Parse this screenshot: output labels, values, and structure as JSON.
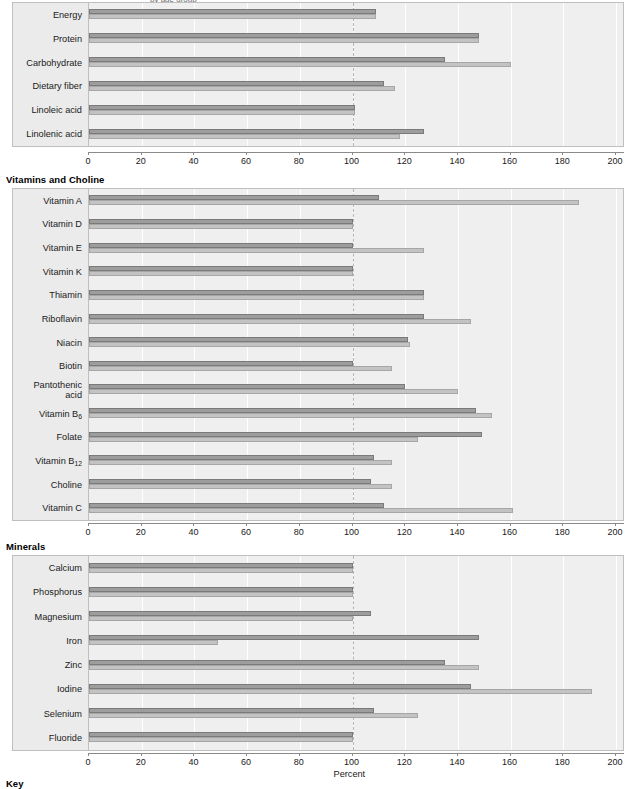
{
  "figure": {
    "axis_title": "Percent",
    "key_label": "Key",
    "clipped_top_text": "by age group"
  },
  "axis": {
    "ticks": [
      0,
      20,
      40,
      60,
      80,
      100,
      120,
      140,
      160,
      180,
      200
    ],
    "min": 0,
    "max": 200,
    "reference_value": 100
  },
  "legend": {
    "series_a_name": "Series A",
    "series_b_name": "Series B"
  },
  "colors": {
    "series_a": "#9d9d9d",
    "series_b": "#c3c3c3",
    "plot_background": "#efefef",
    "label_gutter": "#ebebeb",
    "gridline": "#ffffff",
    "reference_line": "#b5b5b5"
  },
  "sections": [
    {
      "title": "Macronutrients",
      "title_visible": false,
      "categories": [
        "Linolenic acid",
        "Linoleic acid",
        "Dietary fiber",
        "Carbohydrate",
        "Protein",
        "Energy"
      ],
      "series_a": [
        127,
        101,
        112,
        135,
        148,
        109
      ],
      "series_b": [
        118,
        101,
        116,
        160,
        148,
        109
      ]
    },
    {
      "title": "Vitamins and Choline",
      "title_visible": true,
      "categories": [
        "Vitamin C",
        "Choline",
        "Vitamin B₁₂",
        "Folate",
        "Vitamin B₆",
        "Pantothenic acid",
        "Biotin",
        "Niacin",
        "Riboflavin",
        "Thiamin",
        "Vitamin K",
        "Vitamin E",
        "Vitamin D",
        "Vitamin A"
      ],
      "series_a": [
        112,
        107,
        108,
        149,
        147,
        120,
        100,
        121,
        127,
        127,
        100,
        100,
        100,
        110
      ],
      "series_b": [
        161,
        115,
        115,
        125,
        153,
        140,
        115,
        122,
        145,
        127,
        100,
        127,
        100,
        186
      ]
    },
    {
      "title": "Minerals",
      "title_visible": true,
      "categories": [
        "Fluoride",
        "Selenium",
        "Iodine",
        "Zinc",
        "Iron",
        "Magnesium",
        "Phosphorus",
        "Calcium"
      ],
      "series_a": [
        100,
        108,
        145,
        135,
        148,
        107,
        100,
        100
      ],
      "series_b": [
        100,
        125,
        191,
        148,
        49,
        100,
        100,
        100
      ]
    }
  ],
  "category_labels": {
    "vitamin_b12_base": "Vitamin B",
    "vitamin_b12_sub": "12",
    "vitamin_b6_base": "Vitamin B",
    "vitamin_b6_sub": "6",
    "pantothenic_line1": "Pantothenic",
    "pantothenic_line2": "acid"
  },
  "chart_data": {
    "type": "bar",
    "orientation": "horizontal",
    "title": "",
    "subtitle": "",
    "xlabel": "Percent",
    "ylabel": "",
    "xlim": [
      0,
      200
    ],
    "xticks": [
      0,
      20,
      40,
      60,
      80,
      100,
      120,
      140,
      160,
      180,
      200
    ],
    "grid": true,
    "grid_axis": "x",
    "reference_line": 100,
    "legend": "bottom",
    "panels": [
      {
        "panel_title": "Macronutrients",
        "categories": [
          "Linolenic acid",
          "Linoleic acid",
          "Dietary fiber",
          "Carbohydrate",
          "Protein",
          "Energy"
        ],
        "series": [
          {
            "name": "Series A",
            "values": [
              127,
              101,
              112,
              135,
              148,
              109
            ]
          },
          {
            "name": "Series B",
            "values": [
              118,
              101,
              116,
              160,
              148,
              109
            ]
          }
        ]
      },
      {
        "panel_title": "Vitamins and Choline",
        "categories": [
          "Vitamin C",
          "Choline",
          "Vitamin B12",
          "Folate",
          "Vitamin B6",
          "Pantothenic acid",
          "Biotin",
          "Niacin",
          "Riboflavin",
          "Thiamin",
          "Vitamin K",
          "Vitamin E",
          "Vitamin D",
          "Vitamin A"
        ],
        "series": [
          {
            "name": "Series A",
            "values": [
              112,
              107,
              108,
              149,
              147,
              120,
              100,
              121,
              127,
              127,
              100,
              100,
              100,
              110
            ]
          },
          {
            "name": "Series B",
            "values": [
              161,
              115,
              115,
              125,
              153,
              140,
              115,
              122,
              145,
              127,
              100,
              127,
              100,
              186
            ]
          }
        ]
      },
      {
        "panel_title": "Minerals",
        "categories": [
          "Fluoride",
          "Selenium",
          "Iodine",
          "Zinc",
          "Iron",
          "Magnesium",
          "Phosphorus",
          "Calcium"
        ],
        "series": [
          {
            "name": "Series A",
            "values": [
              100,
              108,
              145,
              135,
              148,
              107,
              100,
              100
            ]
          },
          {
            "name": "Series B",
            "values": [
              100,
              125,
              191,
              148,
              49,
              100,
              100,
              100
            ]
          }
        ]
      }
    ]
  }
}
